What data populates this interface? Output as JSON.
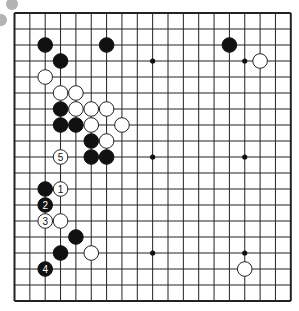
{
  "board": {
    "size": 19,
    "line_color": "#222222",
    "background": "#ffffff",
    "star_points": [
      [
        3,
        3
      ],
      [
        9,
        3
      ],
      [
        15,
        3
      ],
      [
        3,
        9
      ],
      [
        9,
        9
      ],
      [
        15,
        9
      ],
      [
        3,
        15
      ],
      [
        9,
        15
      ],
      [
        15,
        15
      ]
    ],
    "stones": [
      {
        "color": "black",
        "col": 2,
        "row": 2,
        "label": ""
      },
      {
        "color": "black",
        "col": 6,
        "row": 2,
        "label": ""
      },
      {
        "color": "black",
        "col": 14,
        "row": 2,
        "label": ""
      },
      {
        "color": "black",
        "col": 3,
        "row": 3,
        "label": ""
      },
      {
        "color": "white",
        "col": 16,
        "row": 3,
        "label": ""
      },
      {
        "color": "white",
        "col": 2,
        "row": 4,
        "label": ""
      },
      {
        "color": "white",
        "col": 3,
        "row": 5,
        "label": ""
      },
      {
        "color": "white",
        "col": 4,
        "row": 5,
        "label": ""
      },
      {
        "color": "black",
        "col": 3,
        "row": 6,
        "label": ""
      },
      {
        "color": "white",
        "col": 4,
        "row": 6,
        "label": ""
      },
      {
        "color": "white",
        "col": 5,
        "row": 6,
        "label": ""
      },
      {
        "color": "white",
        "col": 6,
        "row": 6,
        "label": ""
      },
      {
        "color": "black",
        "col": 3,
        "row": 7,
        "label": ""
      },
      {
        "color": "black",
        "col": 4,
        "row": 7,
        "label": ""
      },
      {
        "color": "white",
        "col": 5,
        "row": 7,
        "label": ""
      },
      {
        "color": "white",
        "col": 7,
        "row": 7,
        "label": ""
      },
      {
        "color": "black",
        "col": 5,
        "row": 8,
        "label": ""
      },
      {
        "color": "white",
        "col": 6,
        "row": 8,
        "label": ""
      },
      {
        "color": "white",
        "col": 3,
        "row": 9,
        "label": "5"
      },
      {
        "color": "black",
        "col": 5,
        "row": 9,
        "label": ""
      },
      {
        "color": "black",
        "col": 6,
        "row": 9,
        "label": ""
      },
      {
        "color": "black",
        "col": 2,
        "row": 11,
        "label": ""
      },
      {
        "color": "white",
        "col": 3,
        "row": 11,
        "label": "1"
      },
      {
        "color": "black",
        "col": 2,
        "row": 12,
        "label": "2"
      },
      {
        "color": "white",
        "col": 2,
        "row": 13,
        "label": "3"
      },
      {
        "color": "white",
        "col": 3,
        "row": 13,
        "label": ""
      },
      {
        "color": "black",
        "col": 4,
        "row": 14,
        "label": ""
      },
      {
        "color": "black",
        "col": 3,
        "row": 15,
        "label": ""
      },
      {
        "color": "white",
        "col": 5,
        "row": 15,
        "label": ""
      },
      {
        "color": "black",
        "col": 2,
        "row": 16,
        "label": "4"
      },
      {
        "color": "white",
        "col": 15,
        "row": 16,
        "label": ""
      }
    ]
  },
  "colors": {
    "black_stone": "#111111",
    "white_stone": "#ffffff",
    "stone_outline": "#222222",
    "decor_circle": "#b3b3b3"
  }
}
